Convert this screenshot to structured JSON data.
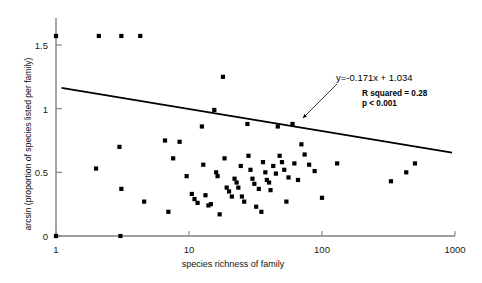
{
  "chart_data": {
    "type": "scatter",
    "title": "",
    "xlabel": "species richness of family",
    "ylabel": "arcsin (proportion of species listed per family)",
    "xscale": "log",
    "yscale": "linear",
    "xlim": [
      1,
      1000
    ],
    "ylim": [
      0,
      1.7
    ],
    "grid": false,
    "legend": null,
    "xticks": [
      {
        "value": 1,
        "label": "1"
      },
      {
        "value": 10,
        "label": "10"
      },
      {
        "value": 100,
        "label": "100"
      },
      {
        "value": 1000,
        "label": "1000"
      }
    ],
    "yticks": [
      {
        "value": 0,
        "label": "0"
      },
      {
        "value": 0.5,
        "label": "0.5"
      },
      {
        "value": 1,
        "label": "1"
      },
      {
        "value": 1.5,
        "label": "1.5"
      }
    ],
    "marker": {
      "shape": "square",
      "color": "#000000",
      "size": 4.2
    },
    "points": [
      {
        "x": 1,
        "y": 1.571
      },
      {
        "x": 2.1,
        "y": 1.571
      },
      {
        "x": 3.1,
        "y": 1.571
      },
      {
        "x": 4.3,
        "y": 1.571
      },
      {
        "x": 18,
        "y": 1.25
      },
      {
        "x": 1,
        "y": 0.0
      },
      {
        "x": 3.05,
        "y": 0.0
      },
      {
        "x": 2.0,
        "y": 0.53
      },
      {
        "x": 3.0,
        "y": 0.7
      },
      {
        "x": 3.1,
        "y": 0.37
      },
      {
        "x": 4.6,
        "y": 0.27
      },
      {
        "x": 6.6,
        "y": 0.75
      },
      {
        "x": 7.0,
        "y": 0.19
      },
      {
        "x": 7.6,
        "y": 0.61
      },
      {
        "x": 8.5,
        "y": 0.74
      },
      {
        "x": 9.6,
        "y": 0.47
      },
      {
        "x": 10.5,
        "y": 0.33
      },
      {
        "x": 11.0,
        "y": 0.29
      },
      {
        "x": 11.6,
        "y": 0.26
      },
      {
        "x": 12.5,
        "y": 0.86
      },
      {
        "x": 12.8,
        "y": 0.56
      },
      {
        "x": 13.3,
        "y": 0.32
      },
      {
        "x": 14.0,
        "y": 0.24
      },
      {
        "x": 14.6,
        "y": 0.25
      },
      {
        "x": 15.5,
        "y": 0.99
      },
      {
        "x": 16.0,
        "y": 0.5
      },
      {
        "x": 16.4,
        "y": 0.47
      },
      {
        "x": 17.0,
        "y": 0.17
      },
      {
        "x": 18.5,
        "y": 0.61
      },
      {
        "x": 19.2,
        "y": 0.38
      },
      {
        "x": 20.0,
        "y": 0.35
      },
      {
        "x": 21.0,
        "y": 0.31
      },
      {
        "x": 22.0,
        "y": 0.45
      },
      {
        "x": 22.8,
        "y": 0.42
      },
      {
        "x": 23.5,
        "y": 0.38
      },
      {
        "x": 24.5,
        "y": 0.55
      },
      {
        "x": 25.0,
        "y": 0.31
      },
      {
        "x": 26.0,
        "y": 0.27
      },
      {
        "x": 27.5,
        "y": 0.88
      },
      {
        "x": 28.0,
        "y": 0.63
      },
      {
        "x": 29.0,
        "y": 0.52
      },
      {
        "x": 30.0,
        "y": 0.45
      },
      {
        "x": 31.0,
        "y": 0.41
      },
      {
        "x": 32.0,
        "y": 0.23
      },
      {
        "x": 33.5,
        "y": 0.37
      },
      {
        "x": 35.0,
        "y": 0.19
      },
      {
        "x": 36.0,
        "y": 0.58
      },
      {
        "x": 37.5,
        "y": 0.5
      },
      {
        "x": 38.5,
        "y": 0.44
      },
      {
        "x": 40.0,
        "y": 0.42
      },
      {
        "x": 41.0,
        "y": 0.36
      },
      {
        "x": 43.0,
        "y": 0.55
      },
      {
        "x": 45.0,
        "y": 0.49
      },
      {
        "x": 46.5,
        "y": 0.86
      },
      {
        "x": 48.0,
        "y": 0.63
      },
      {
        "x": 50.0,
        "y": 0.58
      },
      {
        "x": 52.0,
        "y": 0.52
      },
      {
        "x": 54.0,
        "y": 0.27
      },
      {
        "x": 56.0,
        "y": 0.46
      },
      {
        "x": 60.0,
        "y": 0.88
      },
      {
        "x": 62.0,
        "y": 0.57
      },
      {
        "x": 66.0,
        "y": 0.44
      },
      {
        "x": 70.0,
        "y": 0.72
      },
      {
        "x": 74.0,
        "y": 0.64
      },
      {
        "x": 80.0,
        "y": 0.56
      },
      {
        "x": 88.0,
        "y": 0.51
      },
      {
        "x": 100.0,
        "y": 0.3
      },
      {
        "x": 130.0,
        "y": 0.57
      },
      {
        "x": 330.0,
        "y": 0.43
      },
      {
        "x": 430.0,
        "y": 0.5
      },
      {
        "x": 500.0,
        "y": 0.57
      }
    ],
    "trendline": {
      "equation": "y=-0.171x + 1.034",
      "slope": -0.171,
      "intercept": 1.034,
      "x_start": 1.1,
      "y_start": 1.163,
      "x_end": 950,
      "y_end": 0.655,
      "color": "#000000"
    },
    "annotations": {
      "equation": "y=-0.171x + 1.034",
      "r_squared": "R squared = 0.28",
      "p_value": "p < 0.001",
      "arrow": {
        "from_x": 337,
        "from_y": 84,
        "to_x": 303,
        "to_y": 118
      }
    }
  }
}
